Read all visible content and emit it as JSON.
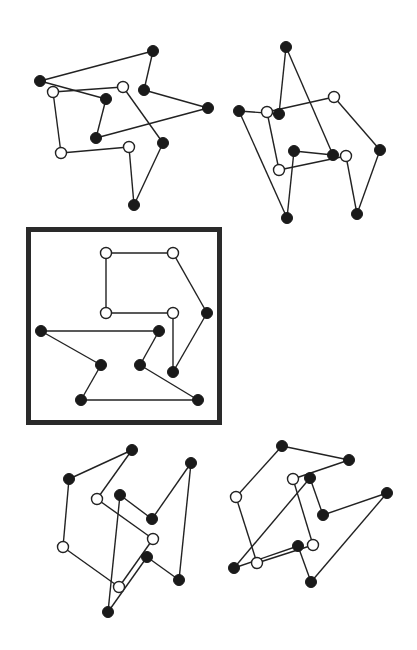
{
  "figure": {
    "node_radius": 5.5,
    "colors": {
      "filled": "#1a1a1a",
      "open": "#ffffff",
      "edge": "#222222",
      "frame": "#2a2a2a"
    },
    "frame": {
      "x": 28.5,
      "y": 229.5,
      "width": 191,
      "height": 193
    },
    "panels": [
      {
        "id": "top-left",
        "highlighted": false,
        "nodes": [
          {
            "x": 153,
            "y": 51,
            "type": "filled"
          },
          {
            "x": 40,
            "y": 81,
            "type": "filled"
          },
          {
            "x": 144,
            "y": 90,
            "type": "filled"
          },
          {
            "x": 208,
            "y": 108,
            "type": "filled"
          },
          {
            "x": 96,
            "y": 138,
            "type": "filled"
          },
          {
            "x": 106,
            "y": 99,
            "type": "filled"
          },
          {
            "x": 53,
            "y": 92,
            "type": "open"
          },
          {
            "x": 123,
            "y": 87,
            "type": "open"
          },
          {
            "x": 163,
            "y": 143,
            "type": "filled"
          },
          {
            "x": 134,
            "y": 205,
            "type": "filled"
          },
          {
            "x": 129,
            "y": 147,
            "type": "open"
          },
          {
            "x": 61,
            "y": 153,
            "type": "open"
          }
        ],
        "edges": [
          [
            0,
            1
          ],
          [
            1,
            5
          ],
          [
            5,
            4
          ],
          [
            4,
            3
          ],
          [
            3,
            2
          ],
          [
            2,
            0
          ],
          [
            6,
            7
          ],
          [
            7,
            8
          ],
          [
            8,
            9
          ],
          [
            9,
            10
          ],
          [
            10,
            11
          ],
          [
            11,
            6
          ]
        ]
      },
      {
        "id": "top-right",
        "highlighted": false,
        "nodes": [
          {
            "x": 286,
            "y": 47,
            "type": "filled"
          },
          {
            "x": 279,
            "y": 114,
            "type": "filled"
          },
          {
            "x": 239,
            "y": 111,
            "type": "filled"
          },
          {
            "x": 287,
            "y": 218,
            "type": "filled"
          },
          {
            "x": 294,
            "y": 151,
            "type": "filled"
          },
          {
            "x": 333,
            "y": 155,
            "type": "filled"
          },
          {
            "x": 267,
            "y": 112,
            "type": "open"
          },
          {
            "x": 334,
            "y": 97,
            "type": "open"
          },
          {
            "x": 380,
            "y": 150,
            "type": "filled"
          },
          {
            "x": 357,
            "y": 214,
            "type": "filled"
          },
          {
            "x": 346,
            "y": 156,
            "type": "open"
          },
          {
            "x": 279,
            "y": 170,
            "type": "open"
          }
        ],
        "edges": [
          [
            0,
            1
          ],
          [
            1,
            2
          ],
          [
            2,
            3
          ],
          [
            3,
            4
          ],
          [
            4,
            5
          ],
          [
            5,
            0
          ],
          [
            6,
            7
          ],
          [
            7,
            8
          ],
          [
            8,
            9
          ],
          [
            9,
            10
          ],
          [
            10,
            11
          ],
          [
            11,
            6
          ]
        ]
      },
      {
        "id": "middle-boxed",
        "highlighted": true,
        "nodes": [
          {
            "x": 106,
            "y": 253,
            "type": "open"
          },
          {
            "x": 173,
            "y": 253,
            "type": "open"
          },
          {
            "x": 207,
            "y": 313,
            "type": "filled"
          },
          {
            "x": 173,
            "y": 372,
            "type": "filled"
          },
          {
            "x": 173,
            "y": 313,
            "type": "open"
          },
          {
            "x": 106,
            "y": 313,
            "type": "open"
          },
          {
            "x": 41,
            "y": 331,
            "type": "filled"
          },
          {
            "x": 159,
            "y": 331,
            "type": "filled"
          },
          {
            "x": 140,
            "y": 365,
            "type": "filled"
          },
          {
            "x": 198,
            "y": 400,
            "type": "filled"
          },
          {
            "x": 81,
            "y": 400,
            "type": "filled"
          },
          {
            "x": 101,
            "y": 365,
            "type": "filled"
          }
        ],
        "edges": [
          [
            0,
            1
          ],
          [
            1,
            2
          ],
          [
            2,
            3
          ],
          [
            3,
            4
          ],
          [
            4,
            5
          ],
          [
            5,
            0
          ],
          [
            6,
            7
          ],
          [
            7,
            8
          ],
          [
            8,
            9
          ],
          [
            9,
            10
          ],
          [
            10,
            11
          ],
          [
            11,
            6
          ]
        ]
      },
      {
        "id": "bottom-left",
        "highlighted": false,
        "nodes": [
          {
            "x": 132,
            "y": 450,
            "type": "filled"
          },
          {
            "x": 69,
            "y": 479,
            "type": "filled"
          },
          {
            "x": 63,
            "y": 547,
            "type": "open"
          },
          {
            "x": 119,
            "y": 587,
            "type": "open"
          },
          {
            "x": 153,
            "y": 539,
            "type": "open"
          },
          {
            "x": 97,
            "y": 499,
            "type": "open"
          },
          {
            "x": 120,
            "y": 495,
            "type": "filled"
          },
          {
            "x": 152,
            "y": 519,
            "type": "filled"
          },
          {
            "x": 191,
            "y": 463,
            "type": "filled"
          },
          {
            "x": 179,
            "y": 580,
            "type": "filled"
          },
          {
            "x": 147,
            "y": 557,
            "type": "filled"
          },
          {
            "x": 108,
            "y": 612,
            "type": "filled"
          }
        ],
        "edges": [
          [
            0,
            1
          ],
          [
            1,
            2
          ],
          [
            2,
            3
          ],
          [
            3,
            4
          ],
          [
            4,
            5
          ],
          [
            5,
            0
          ],
          [
            6,
            7
          ],
          [
            7,
            8
          ],
          [
            8,
            9
          ],
          [
            9,
            10
          ],
          [
            10,
            11
          ],
          [
            11,
            6
          ]
        ]
      },
      {
        "id": "bottom-right",
        "highlighted": false,
        "nodes": [
          {
            "x": 282,
            "y": 446,
            "type": "filled"
          },
          {
            "x": 349,
            "y": 460,
            "type": "filled"
          },
          {
            "x": 293,
            "y": 479,
            "type": "open"
          },
          {
            "x": 313,
            "y": 545,
            "type": "open"
          },
          {
            "x": 257,
            "y": 563,
            "type": "open"
          },
          {
            "x": 236,
            "y": 497,
            "type": "open"
          },
          {
            "x": 310,
            "y": 478,
            "type": "filled"
          },
          {
            "x": 323,
            "y": 515,
            "type": "filled"
          },
          {
            "x": 387,
            "y": 493,
            "type": "filled"
          },
          {
            "x": 311,
            "y": 582,
            "type": "filled"
          },
          {
            "x": 298,
            "y": 546,
            "type": "filled"
          },
          {
            "x": 234,
            "y": 568,
            "type": "filled"
          }
        ],
        "edges": [
          [
            0,
            1
          ],
          [
            1,
            2
          ],
          [
            2,
            3
          ],
          [
            3,
            4
          ],
          [
            4,
            5
          ],
          [
            5,
            0
          ],
          [
            6,
            7
          ],
          [
            7,
            8
          ],
          [
            8,
            9
          ],
          [
            9,
            10
          ],
          [
            10,
            11
          ],
          [
            11,
            6
          ]
        ]
      }
    ]
  }
}
